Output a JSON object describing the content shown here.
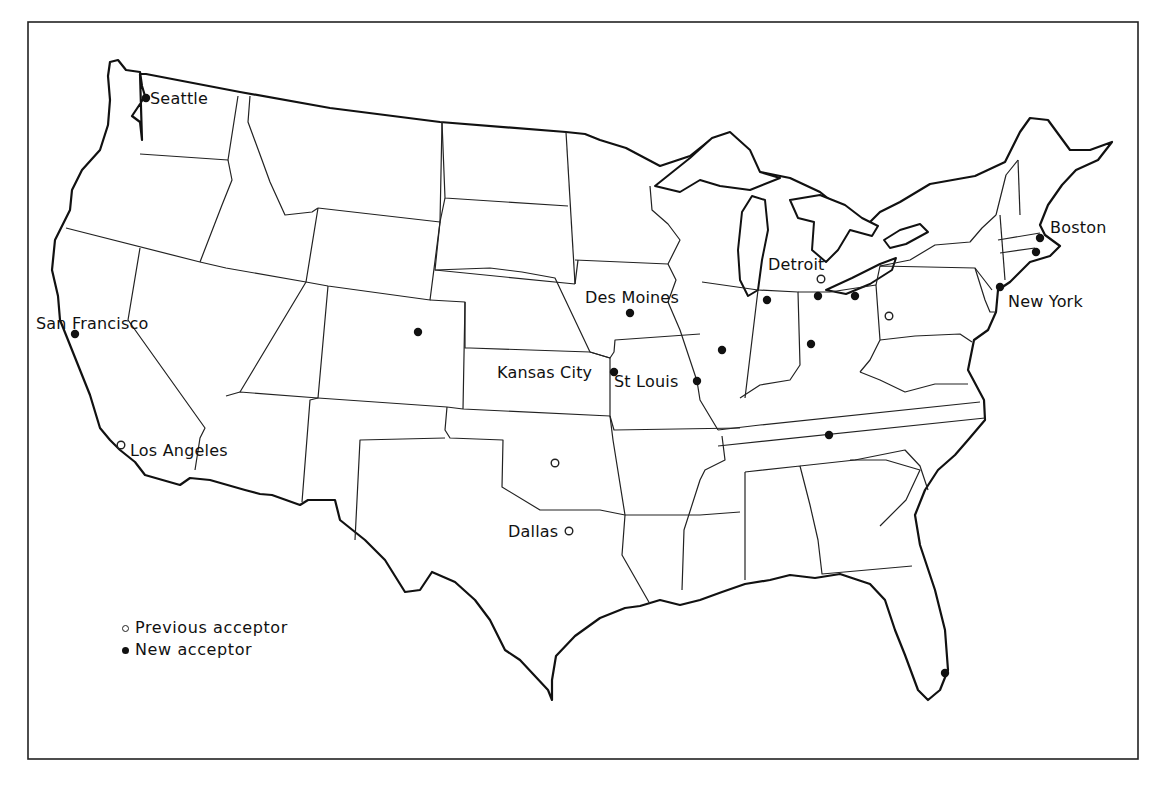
{
  "map": {
    "title": "",
    "frame": {
      "x": 28,
      "y": 22,
      "width": 1110,
      "height": 737
    },
    "colors": {
      "ink": "#111111",
      "background": "#ffffff"
    }
  },
  "legend": {
    "items": [
      {
        "symbol": "open-circle",
        "label": "Previous acceptor"
      },
      {
        "symbol": "filled-circle",
        "label": "New acceptor"
      }
    ]
  },
  "cities": [
    {
      "name": "Seattle",
      "type": "new",
      "x": 146,
      "y": 98,
      "label_x": 150,
      "label_y": 90
    },
    {
      "name": "San Francisco",
      "type": "new",
      "x": 75,
      "y": 334,
      "label_x": 36,
      "label_y": 315
    },
    {
      "name": "Los Angeles",
      "type": "previous",
      "x": 121,
      "y": 445,
      "label_x": 130,
      "label_y": 442
    },
    {
      "name": "Des Moines",
      "type": "new",
      "x": 630,
      "y": 313,
      "label_x": 585,
      "label_y": 289
    },
    {
      "name": "Kansas City",
      "type": "new",
      "x": 614,
      "y": 372,
      "label_x": 497,
      "label_y": 364
    },
    {
      "name": "St Louis",
      "type": "new",
      "x": 697,
      "y": 381,
      "label_x": 614,
      "label_y": 373
    },
    {
      "name": "Detroit",
      "type": "previous",
      "x": 821,
      "y": 279,
      "label_x": 768,
      "label_y": 256
    },
    {
      "name": "Boston",
      "type": "new",
      "x": 1040,
      "y": 238,
      "label_x": 1050,
      "label_y": 219
    },
    {
      "name": "New York",
      "type": "new",
      "x": 1000,
      "y": 287,
      "label_x": 1008,
      "label_y": 293
    },
    {
      "name": "Dallas",
      "type": "previous",
      "x": 569,
      "y": 531,
      "label_x": 508,
      "label_y": 523
    }
  ],
  "unlabeled_markers": [
    {
      "state": "Colorado",
      "type": "new",
      "x": 418,
      "y": 332
    },
    {
      "state": "Illinois",
      "type": "new",
      "x": 722,
      "y": 350
    },
    {
      "state": "Indiana",
      "type": "new",
      "x": 767,
      "y": 300
    },
    {
      "state": "Ohio (Toledo)",
      "type": "new",
      "x": 818,
      "y": 296
    },
    {
      "state": "Ohio (Cleveland)",
      "type": "new",
      "x": 855,
      "y": 296
    },
    {
      "state": "Ohio",
      "type": "new",
      "x": 811,
      "y": 344
    },
    {
      "state": "Tennessee",
      "type": "new",
      "x": 829,
      "y": 435
    },
    {
      "state": "Oklahoma",
      "type": "previous",
      "x": 555,
      "y": 463
    },
    {
      "state": "Pennsylvania",
      "type": "previous",
      "x": 889,
      "y": 316
    },
    {
      "state": "Florida",
      "type": "new",
      "x": 945,
      "y": 673
    },
    {
      "state": "Boston area",
      "type": "new",
      "x": 1036,
      "y": 252
    }
  ]
}
